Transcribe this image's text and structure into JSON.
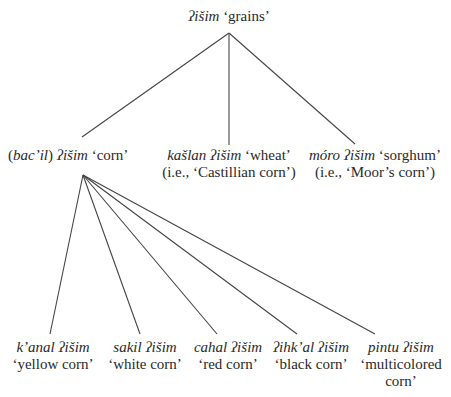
{
  "diagram": {
    "type": "taxonomy-tree",
    "root": {
      "term": "ʔišim",
      "gloss": "‘grains’"
    },
    "level1": [
      {
        "prefix": "(",
        "optional": "bac’il",
        "suffix": ")",
        "term": "ʔišim",
        "gloss": "‘corn’",
        "note": ""
      },
      {
        "term_a": "kašlan",
        "term": "ʔišim",
        "gloss": "‘wheat’",
        "note": "(i.e., ‘Castillian corn’)"
      },
      {
        "term_a": "móro",
        "term": "ʔišim",
        "gloss": "‘sorghum’",
        "note": "(i.e., ‘Moor’s corn’)"
      }
    ],
    "level2": [
      {
        "term_a": "k’anal",
        "term": "ʔišim",
        "gloss": "‘yellow corn’"
      },
      {
        "term_a": "sakil",
        "term": "ʔišim",
        "gloss": "‘white corn’"
      },
      {
        "term_a": "cahal",
        "term": "ʔišim",
        "gloss": "‘red corn’"
      },
      {
        "term_a": "ʔihk’al",
        "term": "ʔišim",
        "gloss": "‘black corn’"
      },
      {
        "term_a": "pintu",
        "term": "ʔišim",
        "gloss": "‘multicolored",
        "gloss2": "corn’"
      }
    ],
    "edges": {
      "root_apex": [
        229,
        33
      ],
      "root_children": [
        [
          82,
          137
        ],
        [
          229,
          145
        ],
        [
          355,
          144
        ]
      ],
      "corn_apex": [
        83,
        175
      ],
      "corn_children": [
        [
          50,
          334
        ],
        [
          140,
          334
        ],
        [
          217,
          334
        ],
        [
          297,
          334
        ],
        [
          375,
          334
        ]
      ]
    },
    "line_color": "#444444"
  }
}
